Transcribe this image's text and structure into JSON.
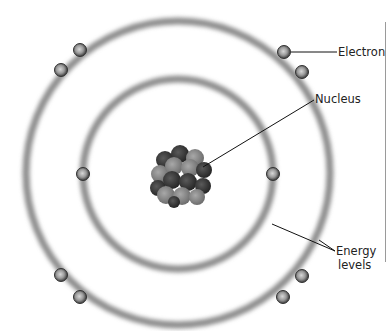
{
  "diagram": {
    "nucleus": {
      "cx": 180,
      "cy": 175
    },
    "inner_ring": {
      "cx": 178,
      "cy": 174,
      "r": 95
    },
    "outer_ring": {
      "cx": 178,
      "cy": 173,
      "r": 152
    },
    "electrons": {
      "inner": [
        {
          "x": 83,
          "y": 174
        },
        {
          "x": 273,
          "y": 174
        }
      ],
      "outer": [
        {
          "x": 80,
          "y": 50
        },
        {
          "x": 61,
          "y": 70
        },
        {
          "x": 284,
          "y": 52
        },
        {
          "x": 302,
          "y": 72
        },
        {
          "x": 61,
          "y": 275
        },
        {
          "x": 80,
          "y": 297
        },
        {
          "x": 302,
          "y": 276
        },
        {
          "x": 283,
          "y": 297
        }
      ]
    },
    "labels": {
      "electron": "Electron",
      "nucleus": "Nucleus",
      "energy_line1": "Energy",
      "energy_line2": "levels"
    },
    "colors": {
      "ring": "#8c8c8c",
      "electron": "#7a7a7a",
      "nucleus_dark": "#3a3a3a",
      "nucleus_light": "#8d8d8d",
      "leader": "#111111"
    }
  }
}
